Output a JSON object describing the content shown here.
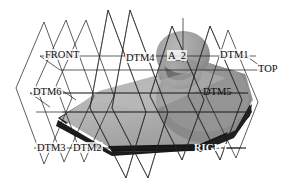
{
  "viewport": {
    "title": "3D CAD model viewport",
    "background_color": "#ffffff",
    "line_color": "#1a1a1a"
  },
  "model": {
    "description": "Shaded 3D solid: rounded wedge / hull body with spherical dome protrusion",
    "top_surface_color": "#b4b4b4",
    "side_surface_color": "#8c8c8c",
    "dome_color": "#a0a0a0",
    "shadow_color": "#2b2b2b",
    "base_band_color": "#1e1e1e"
  },
  "labels": [
    {
      "id": "front",
      "text": "FRONT",
      "x": 44,
      "y": 49,
      "style": "onwhite"
    },
    {
      "id": "dtm4",
      "text": "DTM4",
      "x": 125,
      "y": 52,
      "style": "onwhite"
    },
    {
      "id": "a2",
      "text": "A_2",
      "x": 167,
      "y": 50,
      "style": "onwhite"
    },
    {
      "id": "dtm1",
      "text": "DTM1",
      "x": 219,
      "y": 49,
      "style": "onwhite"
    },
    {
      "id": "top",
      "text": "TOP",
      "x": 257,
      "y": 63,
      "style": "onwhite"
    },
    {
      "id": "dtm6",
      "text": "DTM6",
      "x": 32,
      "y": 86,
      "style": "onwhite"
    },
    {
      "id": "dtm5",
      "text": "DTM5",
      "x": 203,
      "y": 86,
      "style": "shade"
    },
    {
      "id": "dtm3",
      "text": "DTM3",
      "x": 36,
      "y": 142,
      "style": "onwhite"
    },
    {
      "id": "dtm2",
      "text": "DTM2",
      "x": 72,
      "y": 142,
      "style": "onwhite"
    },
    {
      "id": "right",
      "text": "RIGHT",
      "x": 194,
      "y": 142,
      "style": "ondark"
    }
  ],
  "datum_planes": {
    "count": 9,
    "names": [
      "FRONT",
      "TOP",
      "RIGHT",
      "DTM1",
      "DTM2",
      "DTM3",
      "DTM4",
      "DTM5",
      "DTM6"
    ],
    "axis": "A_2"
  }
}
